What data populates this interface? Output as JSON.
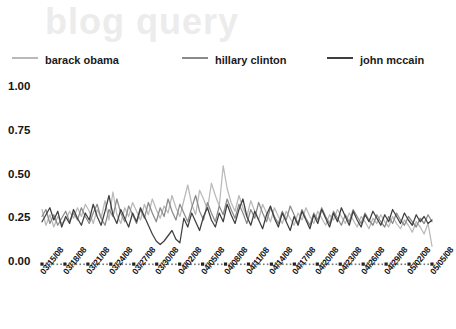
{
  "chart_data": {
    "type": "line",
    "title": "blog query",
    "xlabel": "",
    "ylabel": "",
    "ylim": [
      0.0,
      1.0
    ],
    "yticks": [
      "0.00",
      "0.25",
      "0.50",
      "0.75",
      "1.00"
    ],
    "ytick_values": [
      0.0,
      0.25,
      0.5,
      0.75,
      1.0
    ],
    "grid": false,
    "legend_position": "top",
    "x_tick_labels": [
      "03/15/08",
      "03/18/08",
      "03/21/08",
      "03/24/08",
      "03/27/08",
      "03/30/08",
      "04/02/08",
      "04/05/08",
      "04/08/08",
      "04/11/08",
      "04/14/08",
      "04/17/08",
      "04/20/08",
      "04/23/08",
      "04/26/08",
      "04/29/08",
      "05/02/08",
      "05/05/08"
    ],
    "x_tick_step_days": 3,
    "x_start": "03/15/08",
    "x_end": "05/05/08",
    "series": [
      {
        "name": "barack obama",
        "color": "#b9b9b9",
        "values": [
          0.3,
          0.21,
          0.27,
          0.2,
          0.26,
          0.22,
          0.24,
          0.29,
          0.25,
          0.31,
          0.26,
          0.33,
          0.29,
          0.22,
          0.3,
          0.25,
          0.35,
          0.24,
          0.4,
          0.27,
          0.22,
          0.31,
          0.26,
          0.34,
          0.29,
          0.24,
          0.33,
          0.27,
          0.36,
          0.3,
          0.25,
          0.32,
          0.28,
          0.38,
          0.31,
          0.26,
          0.35,
          0.44,
          0.33,
          0.27,
          0.41,
          0.36,
          0.3,
          0.45,
          0.38,
          0.32,
          0.55,
          0.42,
          0.34,
          0.29,
          0.38,
          0.31,
          0.26,
          0.35,
          0.29,
          0.24,
          0.33,
          0.28,
          0.23,
          0.31,
          0.26,
          0.22,
          0.29,
          0.25,
          0.21,
          0.28,
          0.24,
          0.31,
          0.26,
          0.22,
          0.29,
          0.25,
          0.21,
          0.27,
          0.24,
          0.3,
          0.26,
          0.22,
          0.28,
          0.24,
          0.2,
          0.26,
          0.23,
          0.19,
          0.25,
          0.22,
          0.27,
          0.23,
          0.2,
          0.26,
          0.22,
          0.19,
          0.24,
          0.21,
          0.17,
          0.23,
          0.2,
          0.16,
          0.22,
          0.09
        ]
      },
      {
        "name": "hillary clinton",
        "color": "#8a8a8a",
        "values": [
          0.26,
          0.3,
          0.22,
          0.27,
          0.21,
          0.25,
          0.29,
          0.23,
          0.28,
          0.24,
          0.31,
          0.26,
          0.22,
          0.28,
          0.33,
          0.25,
          0.21,
          0.3,
          0.26,
          0.36,
          0.28,
          0.23,
          0.32,
          0.27,
          0.22,
          0.3,
          0.25,
          0.34,
          0.28,
          0.23,
          0.31,
          0.26,
          0.36,
          0.29,
          0.24,
          0.33,
          0.28,
          0.23,
          0.31,
          0.38,
          0.29,
          0.24,
          0.34,
          0.28,
          0.23,
          0.32,
          0.27,
          0.36,
          0.3,
          0.25,
          0.33,
          0.28,
          0.22,
          0.3,
          0.25,
          0.34,
          0.28,
          0.23,
          0.31,
          0.26,
          0.22,
          0.29,
          0.24,
          0.32,
          0.27,
          0.22,
          0.3,
          0.25,
          0.21,
          0.28,
          0.24,
          0.31,
          0.26,
          0.22,
          0.29,
          0.25,
          0.21,
          0.27,
          0.23,
          0.3,
          0.26,
          0.22,
          0.28,
          0.24,
          0.21,
          0.27,
          0.23,
          0.2,
          0.26,
          0.22,
          0.28,
          0.24,
          0.21,
          0.26,
          0.23,
          0.2,
          0.25,
          0.22,
          0.27,
          0.23
        ]
      },
      {
        "name": "john mccain",
        "color": "#3f3f3f",
        "values": [
          0.23,
          0.27,
          0.31,
          0.24,
          0.29,
          0.2,
          0.26,
          0.22,
          0.3,
          0.25,
          0.21,
          0.28,
          0.24,
          0.33,
          0.26,
          0.21,
          0.29,
          0.38,
          0.27,
          0.22,
          0.3,
          0.25,
          0.2,
          0.28,
          0.23,
          0.31,
          0.26,
          0.21,
          0.16,
          0.12,
          0.1,
          0.12,
          0.15,
          0.18,
          0.13,
          0.11,
          0.25,
          0.2,
          0.28,
          0.23,
          0.18,
          0.26,
          0.31,
          0.24,
          0.2,
          0.28,
          0.23,
          0.33,
          0.27,
          0.22,
          0.3,
          0.36,
          0.26,
          0.21,
          0.29,
          0.24,
          0.19,
          0.27,
          0.32,
          0.25,
          0.2,
          0.28,
          0.23,
          0.18,
          0.26,
          0.21,
          0.29,
          0.24,
          0.19,
          0.27,
          0.22,
          0.3,
          0.25,
          0.2,
          0.28,
          0.23,
          0.31,
          0.26,
          0.21,
          0.29,
          0.24,
          0.2,
          0.27,
          0.23,
          0.29,
          0.25,
          0.21,
          0.27,
          0.23,
          0.3,
          0.26,
          0.22,
          0.28,
          0.24,
          0.21,
          0.27,
          0.23,
          0.26,
          0.22,
          0.24
        ]
      }
    ]
  },
  "legend": {
    "items": [
      {
        "label": "barack obama"
      },
      {
        "label": "hillary clinton"
      },
      {
        "label": "john mccain"
      }
    ]
  }
}
